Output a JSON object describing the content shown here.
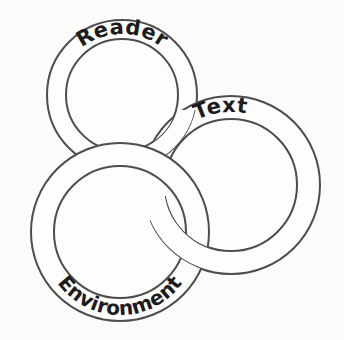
{
  "figure": {
    "type": "venn-interlocking-rings-diagram",
    "background_color": "#fbfbfa",
    "stroke_color": "#4d4d4d",
    "label_color": "#1c1c1c",
    "ring_fill_color": "#fdfdfc"
  },
  "rings": [
    {
      "id": "reader",
      "label": "Reader",
      "label_position": "top-arc",
      "center_x": 122,
      "center_y": 95,
      "outer_radius": 75,
      "inner_radius": 56
    },
    {
      "id": "text",
      "label": "Text",
      "label_position": "top-arc",
      "center_x": 231,
      "center_y": 185,
      "outer_radius": 89,
      "inner_radius": 66
    },
    {
      "id": "environment",
      "label": "Environment",
      "label_position": "bottom-arc",
      "center_x": 120,
      "center_y": 232,
      "outer_radius": 89,
      "inner_radius": 66
    }
  ],
  "overlaps": [
    {
      "over": "environment",
      "under": "reader"
    },
    {
      "over": "reader",
      "under": "text"
    },
    {
      "over": "text",
      "under": "environment"
    }
  ]
}
